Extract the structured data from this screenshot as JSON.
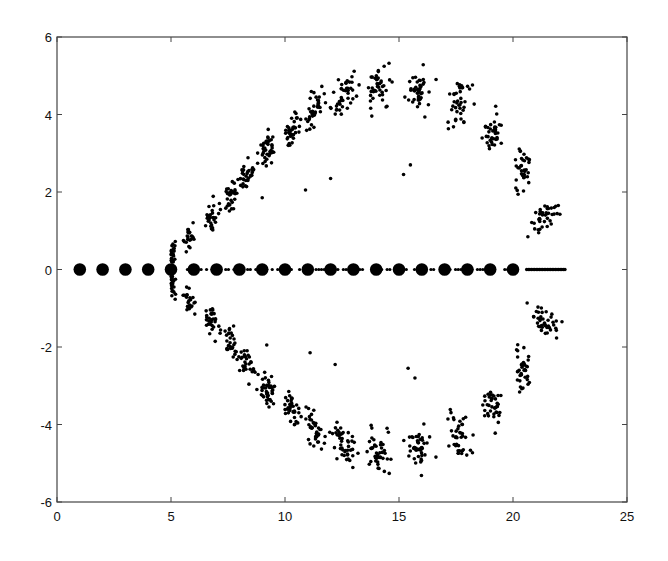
{
  "chart_data": {
    "type": "scatter",
    "title": "",
    "xlabel": "",
    "ylabel": "",
    "xlim": [
      0,
      25
    ],
    "ylim": [
      -6,
      6
    ],
    "xticks": [
      0,
      5,
      10,
      15,
      20,
      25
    ],
    "yticks": [
      -6,
      -4,
      -2,
      0,
      2,
      4,
      6
    ],
    "xtick_labels": [
      "0",
      "5",
      "10",
      "15",
      "20",
      "25"
    ],
    "ytick_labels": [
      "-6",
      "-4",
      "-2",
      "0",
      "2",
      "4",
      "6"
    ],
    "grid": false,
    "legend": null,
    "symmetric_about_x_axis": true,
    "series": [
      {
        "name": "exact eigenvalues",
        "marker": "large filled circle",
        "x": [
          1,
          2,
          3,
          4,
          5,
          6,
          7,
          8,
          9,
          10,
          11,
          12,
          13,
          14,
          15,
          16,
          17,
          18,
          19,
          20
        ],
        "y": [
          0,
          0,
          0,
          0,
          0,
          0,
          0,
          0,
          0,
          0,
          0,
          0,
          0,
          0,
          0,
          0,
          0,
          0,
          0,
          0
        ]
      },
      {
        "name": "perturbed eigenvalues (real axis)",
        "marker": "small dot",
        "x_range": [
          5,
          22.3
        ],
        "y": 0,
        "note": "dense small dots along real axis between large dots and from 20.6 to 22.3"
      },
      {
        "name": "perturbed eigenvalue clusters (upper half, mirrored below)",
        "marker": "small dot",
        "clusters": [
          {
            "x": 5.1,
            "y": 0.35,
            "spread": [
              0.08,
              0.3
            ],
            "n": 14
          },
          {
            "x": 5.8,
            "y": 0.75,
            "spread": [
              0.2,
              0.3
            ],
            "n": 22
          },
          {
            "x": 6.8,
            "y": 1.3,
            "spread": [
              0.25,
              0.35
            ],
            "n": 28
          },
          {
            "x": 7.6,
            "y": 1.9,
            "spread": [
              0.3,
              0.35
            ],
            "n": 32
          },
          {
            "x": 8.3,
            "y": 2.4,
            "spread": [
              0.3,
              0.35
            ],
            "n": 32
          },
          {
            "x": 9.2,
            "y": 3.05,
            "spread": [
              0.35,
              0.4
            ],
            "n": 42
          },
          {
            "x": 10.3,
            "y": 3.6,
            "spread": [
              0.35,
              0.35
            ],
            "n": 36
          },
          {
            "x": 11.3,
            "y": 4.1,
            "spread": [
              0.35,
              0.4
            ],
            "n": 38
          },
          {
            "x": 12.6,
            "y": 4.5,
            "spread": [
              0.45,
              0.4
            ],
            "n": 44
          },
          {
            "x": 14.1,
            "y": 4.7,
            "spread": [
              0.45,
              0.45
            ],
            "n": 44
          },
          {
            "x": 15.9,
            "y": 4.6,
            "spread": [
              0.5,
              0.5
            ],
            "n": 44
          },
          {
            "x": 17.7,
            "y": 4.3,
            "spread": [
              0.45,
              0.55
            ],
            "n": 40
          },
          {
            "x": 19.1,
            "y": 3.6,
            "spread": [
              0.35,
              0.6
            ],
            "n": 38
          },
          {
            "x": 20.4,
            "y": 2.6,
            "spread": [
              0.35,
              0.5
            ],
            "n": 36
          },
          {
            "x": 21.4,
            "y": 1.35,
            "spread": [
              0.55,
              0.3
            ],
            "n": 40
          }
        ],
        "outliers": [
          {
            "x": 12.0,
            "y": 2.35
          },
          {
            "x": 15.2,
            "y": 2.45
          },
          {
            "x": 15.5,
            "y": 2.7
          },
          {
            "x": 10.9,
            "y": 2.05
          },
          {
            "x": 9.0,
            "y": 1.85
          }
        ]
      }
    ]
  },
  "style": {
    "axis_color": "#444444",
    "marker_color": "#000000",
    "background": "#ffffff"
  },
  "layout": {
    "plot_left": 57,
    "plot_right": 627,
    "plot_top": 37,
    "plot_bottom": 502
  }
}
